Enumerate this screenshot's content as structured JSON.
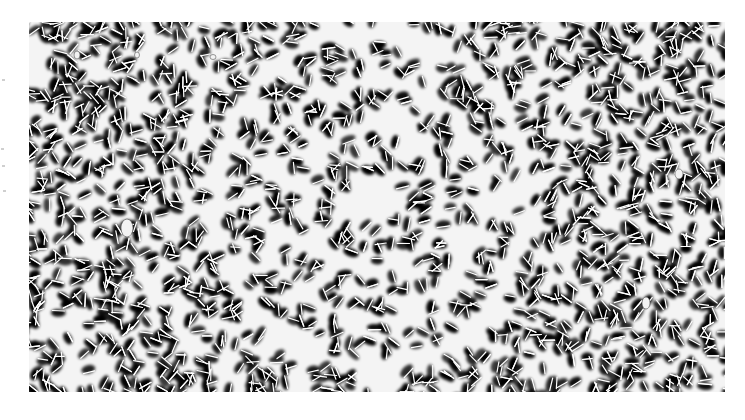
{
  "image": {
    "description": "Grayscale photograph of densely packed elongated particles self-organized into concentric rings around a bare center, surrounded by a disordered dense field",
    "canvas": {
      "width": 745,
      "height": 420,
      "background": "#ffffff"
    },
    "photo_bounds": {
      "x": 29,
      "y": 22,
      "width": 696,
      "height": 370
    },
    "colors": {
      "background": "#f4f4f4",
      "particle_shadow": "#000000",
      "particle_highlight": "#ffffff"
    },
    "ring_center": {
      "x": 344,
      "y": 176
    },
    "ring_aspect_y": 1.08,
    "particle_bands": [
      {
        "name": "ring-1",
        "r_inner": 27,
        "r_outer": 58
      },
      {
        "name": "ring-2",
        "r_inner": 74,
        "r_outer": 104
      },
      {
        "name": "ring-3",
        "r_inner": 117,
        "r_outer": 147
      },
      {
        "name": "outer-field",
        "r_inner": 164,
        "r_outer": 2000
      }
    ],
    "white_blobs": [
      {
        "x": 48,
        "y": 33,
        "rx": 3,
        "ry": 4
      },
      {
        "x": 108,
        "y": 33,
        "rx": 2.5,
        "ry": 3
      },
      {
        "x": 184,
        "y": 35,
        "rx": 3,
        "ry": 2.5
      },
      {
        "x": 98,
        "y": 206,
        "rx": 6,
        "ry": 9
      },
      {
        "x": 650,
        "y": 152,
        "rx": 4,
        "ry": 5
      },
      {
        "x": 617,
        "y": 281,
        "rx": 4,
        "ry": 6
      }
    ]
  }
}
